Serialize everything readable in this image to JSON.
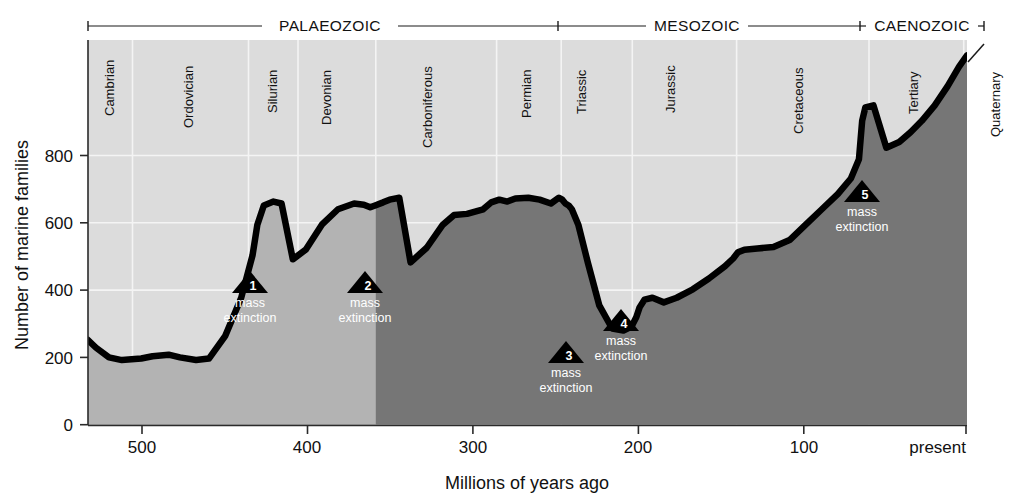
{
  "figure": {
    "axis": {
      "y_title": "Number of marine families",
      "x_title": "Millions of years ago",
      "y_ticks": [
        "0",
        "200",
        "400",
        "600",
        "800"
      ],
      "x_ticks": [
        "500",
        "400",
        "300",
        "200",
        "100",
        "present"
      ]
    },
    "eras": [
      {
        "name": "PALAEOZOIC"
      },
      {
        "name": "MESOZOIC"
      },
      {
        "name": "CAENOZOIC"
      }
    ],
    "periods": [
      {
        "name": "Cambrian"
      },
      {
        "name": "Ordovician"
      },
      {
        "name": "Silurian"
      },
      {
        "name": "Devonian"
      },
      {
        "name": "Carboniferous"
      },
      {
        "name": "Permian"
      },
      {
        "name": "Triassic"
      },
      {
        "name": "Jurassic"
      },
      {
        "name": "Cretaceous"
      },
      {
        "name": "Tertiary"
      },
      {
        "name": "Quaternary"
      }
    ],
    "extinctions": [
      {
        "number": "1",
        "line1": "mass",
        "line2": "extinction"
      },
      {
        "number": "2",
        "line1": "mass",
        "line2": "extinction"
      },
      {
        "number": "3",
        "line1": "mass",
        "line2": "extinction"
      },
      {
        "number": "4",
        "line1": "mass",
        "line2": "extinction"
      },
      {
        "number": "5",
        "line1": "mass",
        "line2": "extinction"
      }
    ],
    "colors": {
      "plot_background": "#dcdcdc",
      "fill_light": "#b5b5b5",
      "fill_dark": "#767676",
      "curve": "#000000",
      "gridline": "#f2f2f2"
    }
  },
  "chart_data": {
    "type": "area",
    "title": "",
    "xlabel": "Millions of years ago",
    "ylabel": "Number of marine families",
    "xlim": [
      545,
      0
    ],
    "ylim": [
      0,
      1000
    ],
    "x_ticks": [
      500,
      400,
      300,
      200,
      100,
      0
    ],
    "x_tick_labels": [
      "500",
      "400",
      "300",
      "200",
      "100",
      "present"
    ],
    "y_ticks": [
      0,
      200,
      400,
      600,
      800
    ],
    "grid": true,
    "legend": "none",
    "x_axis_direction": "reversed",
    "series": [
      {
        "name": "Number of marine families",
        "x": [
          545,
          540,
          532,
          524,
          512,
          505,
          495,
          488,
          478,
          470,
          460,
          450,
          443,
          440,
          436,
          430,
          425,
          418,
          410,
          400,
          390,
          380,
          374,
          370,
          367,
          362,
          358,
          352,
          345,
          335,
          325,
          318,
          310,
          300,
          295,
          290,
          285,
          280,
          272,
          265,
          258,
          253,
          251,
          249,
          247,
          245,
          241,
          235,
          228,
          220,
          213,
          208,
          205,
          203,
          200,
          195,
          188,
          180,
          170,
          160,
          150,
          145,
          142,
          138,
          130,
          120,
          110,
          100,
          90,
          80,
          72,
          67,
          66,
          65,
          63,
          58,
          50,
          42,
          35,
          28,
          20,
          12,
          5,
          0
        ],
        "y": [
          220,
          200,
          175,
          168,
          172,
          178,
          182,
          175,
          168,
          172,
          230,
          330,
          440,
          520,
          570,
          580,
          575,
          430,
          455,
          520,
          560,
          575,
          572,
          565,
          570,
          578,
          585,
          590,
          422,
          460,
          520,
          545,
          548,
          560,
          578,
          585,
          580,
          588,
          590,
          585,
          575,
          590,
          585,
          575,
          570,
          560,
          520,
          420,
          310,
          250,
          245,
          255,
          280,
          305,
          325,
          330,
          318,
          330,
          352,
          380,
          412,
          432,
          448,
          455,
          458,
          462,
          480,
          520,
          560,
          600,
          640,
          690,
          740,
          790,
          825,
          830,
          720,
          735,
          760,
          790,
          830,
          880,
          930,
          960
        ],
        "color": "#000000"
      }
    ],
    "annotations": [
      {
        "label": "1 mass extinction",
        "x": 440,
        "y": 430,
        "event": "End-Ordovician"
      },
      {
        "label": "2 mass extinction",
        "x": 368,
        "y": 420,
        "event": "Late Devonian"
      },
      {
        "label": "3 mass extinction",
        "x": 248,
        "y": 245,
        "event": "End-Permian"
      },
      {
        "label": "4 mass extinction",
        "x": 205,
        "y": 310,
        "event": "End-Triassic"
      },
      {
        "label": "5 mass extinction",
        "x": 65,
        "y": 700,
        "event": "End-Cretaceous"
      }
    ],
    "era_spans": [
      {
        "name": "PALAEOZOIC",
        "start": 545,
        "end": 251
      },
      {
        "name": "MESOZOIC",
        "start": 251,
        "end": 65
      },
      {
        "name": "CAENOZOIC",
        "start": 65,
        "end": 0
      }
    ],
    "period_spans": [
      {
        "name": "Cambrian",
        "start": 545,
        "end": 510
      },
      {
        "name": "Ordovician",
        "start": 510,
        "end": 440
      },
      {
        "name": "Silurian",
        "start": 440,
        "end": 410
      },
      {
        "name": "Devonian",
        "start": 410,
        "end": 363
      },
      {
        "name": "Carboniferous",
        "start": 363,
        "end": 290
      },
      {
        "name": "Permian",
        "start": 290,
        "end": 251
      },
      {
        "name": "Triassic",
        "start": 251,
        "end": 208
      },
      {
        "name": "Jurassic",
        "start": 208,
        "end": 145
      },
      {
        "name": "Cretaceous",
        "start": 145,
        "end": 65
      },
      {
        "name": "Tertiary",
        "start": 65,
        "end": 2
      },
      {
        "name": "Quaternary",
        "start": 2,
        "end": 0
      }
    ]
  }
}
